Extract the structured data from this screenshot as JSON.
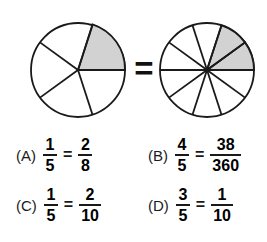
{
  "figure": {
    "relation_symbol": "=",
    "left_circle": {
      "name": "fifths-circle",
      "total_sectors": 5,
      "shaded_sectors": 1,
      "fraction": "1/5",
      "center_x": 78,
      "center_y": 70,
      "radius": 47,
      "sector_boundary_degrees": [
        0,
        72,
        144,
        216,
        288
      ],
      "shaded_sector_ranges": [
        [
          0,
          72
        ]
      ],
      "shaded_color": "#d2d2d2",
      "stroke_color": "#1a1a1a",
      "fill_color": "#ffffff"
    },
    "right_circle": {
      "name": "tenths-circle",
      "total_sectors": 10,
      "shaded_sectors": 2,
      "fraction": "2/10",
      "center_x": 207,
      "center_y": 70,
      "radius": 47,
      "sector_boundary_degrees": [
        0,
        36,
        72,
        108,
        144,
        180,
        216,
        252,
        288,
        324
      ],
      "shaded_sector_ranges": [
        [
          0,
          36
        ],
        [
          36,
          72
        ]
      ],
      "shaded_color": "#d2d2d2",
      "stroke_color": "#1a1a1a",
      "fill_color": "#ffffff"
    }
  },
  "options": [
    {
      "id": "a",
      "label": "(A)",
      "left_numerator": "1",
      "left_denominator": "5",
      "operator": "=",
      "right_numerator": "2",
      "right_denominator": "8"
    },
    {
      "id": "b",
      "label": "(B)",
      "left_numerator": "4",
      "left_denominator": "5",
      "operator": "=",
      "right_numerator": "38",
      "right_denominator": "360"
    },
    {
      "id": "c",
      "label": "(C)",
      "left_numerator": "1",
      "left_denominator": "5",
      "operator": "=",
      "right_numerator": "2",
      "right_denominator": "10"
    },
    {
      "id": "d",
      "label": "(D)",
      "left_numerator": "3",
      "left_denominator": "5",
      "operator": "=",
      "right_numerator": "1",
      "right_denominator": "10"
    }
  ]
}
